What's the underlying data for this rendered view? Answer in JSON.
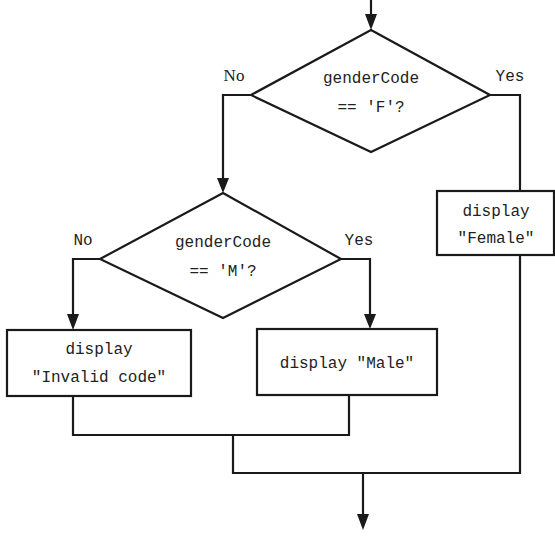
{
  "diagram": {
    "type": "flowchart",
    "colors": {
      "stroke": "#1a1a1a",
      "text": "#222222",
      "background": "#ffffff"
    },
    "decisions": [
      {
        "id": "d1",
        "line1": "genderCode",
        "line2": "== 'F'?",
        "no_label": "No",
        "yes_label": "Yes"
      },
      {
        "id": "d2",
        "line1": "genderCode",
        "line2": "== 'M'?",
        "no_label": "No",
        "yes_label": "Yes"
      }
    ],
    "processes": [
      {
        "id": "female",
        "line1": "display",
        "line2": "\"Female\""
      },
      {
        "id": "invalid",
        "line1": "display",
        "line2": "\"Invalid code\""
      },
      {
        "id": "male",
        "line1": "display \"Male\""
      }
    ],
    "edges": [
      {
        "from": "start",
        "to": "d1"
      },
      {
        "from": "d1",
        "to": "d2",
        "label": "No"
      },
      {
        "from": "d1",
        "to": "female",
        "label": "Yes"
      },
      {
        "from": "d2",
        "to": "invalid",
        "label": "No"
      },
      {
        "from": "d2",
        "to": "male",
        "label": "Yes"
      },
      {
        "from": "invalid",
        "to": "merge"
      },
      {
        "from": "male",
        "to": "merge"
      },
      {
        "from": "female",
        "to": "merge"
      },
      {
        "from": "merge",
        "to": "end"
      }
    ]
  }
}
